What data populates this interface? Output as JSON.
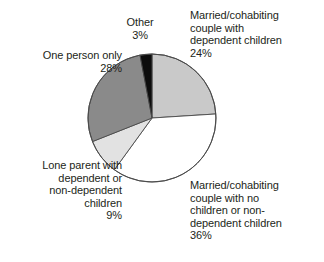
{
  "chart_data": {
    "type": "pie",
    "title": "",
    "xlabel": "",
    "ylabel": "",
    "legend_position": "around-slices",
    "grid": false,
    "units": "percent",
    "start_angle_deg": 0,
    "direction": "clockwise",
    "categories": [
      "Married/cohabiting couple with dependent children",
      "Married/cohabiting couple with no children or non-dependent children",
      "Lone parent with dependent or non-dependent children",
      "One person only",
      "Other"
    ],
    "values": [
      24,
      36,
      9,
      28,
      3
    ],
    "colors": [
      "#c9c9c9",
      "#ffffff",
      "#e2e2e2",
      "#8a8a8a",
      "#0d0d0d"
    ],
    "slices": [
      {
        "key": "married_dependent",
        "name": "Married/cohabiting couple with dependent children",
        "value": 24,
        "value_label": "24%",
        "color": "#c9c9c9"
      },
      {
        "key": "married_nochildren",
        "name": "Married/cohabiting couple with no children or non-dependent children",
        "value": 36,
        "value_label": "36%",
        "color": "#ffffff"
      },
      {
        "key": "lone_parent",
        "name": "Lone parent with dependent or non-dependent children",
        "value": 9,
        "value_label": "9%",
        "color": "#e2e2e2"
      },
      {
        "key": "one_person",
        "name": "One person only",
        "value": 28,
        "value_label": "28%",
        "color": "#8a8a8a"
      },
      {
        "key": "other",
        "name": "Other",
        "value": 3,
        "value_label": "3%",
        "color": "#0d0d0d"
      }
    ]
  },
  "labels": {
    "married_dependent": "Married/cohabiting\ncouple with\ndependent children\n24%",
    "married_nochildren": "Married/cohabiting\ncouple with no\nchildren or non-\ndependent children\n36%",
    "lone_parent": "Lone parent with\ndependent or\nnon-dependent\nchildren\n9%",
    "one_person": "One person only\n28%",
    "other": "Other\n3%"
  },
  "style": {
    "outline_color": "#4a4a4a",
    "text_color": "#231f20",
    "background": "#ffffff"
  }
}
